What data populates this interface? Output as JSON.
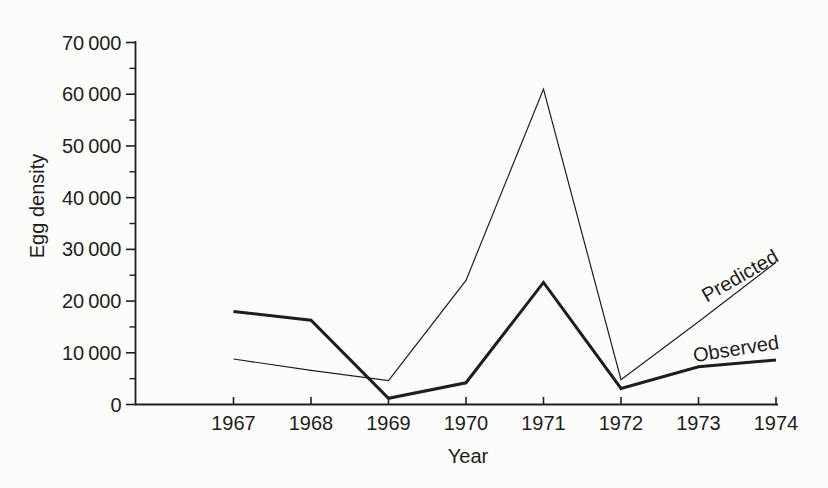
{
  "figure": {
    "background_color": "#fcfcfb",
    "ink_color": "#1e1e1e"
  },
  "chart_data": {
    "type": "line",
    "title": "",
    "xlabel": "Year",
    "ylabel": "Egg density",
    "x": [
      1967,
      1968,
      1969,
      1970,
      1971,
      1972,
      1973,
      1974
    ],
    "x_tick_labels": [
      "1967",
      "1968",
      "1969",
      "1970",
      "1971",
      "1972",
      "1973",
      "1974"
    ],
    "ylim": [
      0,
      70000
    ],
    "y_major_ticks": [
      0,
      10000,
      20000,
      30000,
      40000,
      50000,
      60000,
      70000
    ],
    "y_tick_labels": [
      "0",
      "10 000",
      "20 000",
      "30 000",
      "40 000",
      "50 000",
      "60 000",
      "70 000"
    ],
    "y_minor_tick_step": 5000,
    "grid": false,
    "legend": "inline-labels-on-lines",
    "series": [
      {
        "name": "Predicted",
        "line_style": "thin",
        "values": [
          8800,
          6600,
          4600,
          24000,
          61000,
          4800,
          16000,
          27500
        ]
      },
      {
        "name": "Observed",
        "line_style": "thick",
        "values": [
          18000,
          16300,
          1200,
          4200,
          23600,
          3100,
          7300,
          8600
        ]
      }
    ]
  }
}
